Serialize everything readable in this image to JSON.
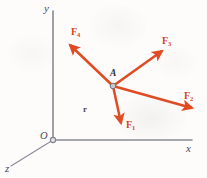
{
  "figure": {
    "width": 207,
    "height": 178,
    "background_color": "#fdfcfb"
  },
  "colors": {
    "vector": "#e04b22",
    "vector_dark": "#d8441f",
    "axis": "#8a8a96",
    "axis_label": "#4a4a55",
    "point": "#7e7e8c",
    "point_label": "#2e2e36"
  },
  "axes": {
    "origin": {
      "label": "O",
      "x": 53,
      "y": 140
    },
    "items": [
      {
        "name": "x-axis",
        "label": "x",
        "label_x": 186,
        "label_y": 144,
        "x1": 53,
        "y1": 140,
        "x2": 192,
        "y2": 140
      },
      {
        "name": "y-axis",
        "label": "y",
        "label_x": 44,
        "label_y": 4,
        "x1": 53,
        "y1": 140,
        "x2": 53,
        "y2": 11
      },
      {
        "name": "z-axis",
        "label": "z",
        "label_x": 5,
        "label_y": 164,
        "x1": 53,
        "y1": 140,
        "x2": 11,
        "y2": 166
      }
    ]
  },
  "point_a": {
    "label": "A",
    "x": 113,
    "y": 86,
    "label_x": 108,
    "label_y": 70,
    "radius": 2.6
  },
  "position_vector": {
    "label": "r",
    "label_x": 83,
    "label_y": 106,
    "description": "position vector label between origin and point A"
  },
  "forces": [
    {
      "name": "F1",
      "label": "F",
      "subscript": "1",
      "tail_x": 113,
      "tail_y": 86,
      "tip_x": 122,
      "tip_y": 128,
      "label_x": 127,
      "label_y": 121,
      "direction": "down-slightly-right"
    },
    {
      "name": "F2",
      "label": "F",
      "subscript": "2",
      "tail_x": 113,
      "tail_y": 86,
      "tip_x": 196,
      "tip_y": 110,
      "label_x": 186,
      "label_y": 92,
      "direction": "right-and-down"
    },
    {
      "name": "F3",
      "label": "F",
      "subscript": "3",
      "tail_x": 113,
      "tail_y": 86,
      "tip_x": 166,
      "tip_y": 48,
      "label_x": 163,
      "label_y": 37,
      "direction": "up-right"
    },
    {
      "name": "F4",
      "label": "F",
      "subscript": "4",
      "tail_x": 113,
      "tail_y": 86,
      "tip_x": 66,
      "tip_y": 41,
      "label_x": 72,
      "label_y": 28,
      "direction": "up-left"
    }
  ]
}
